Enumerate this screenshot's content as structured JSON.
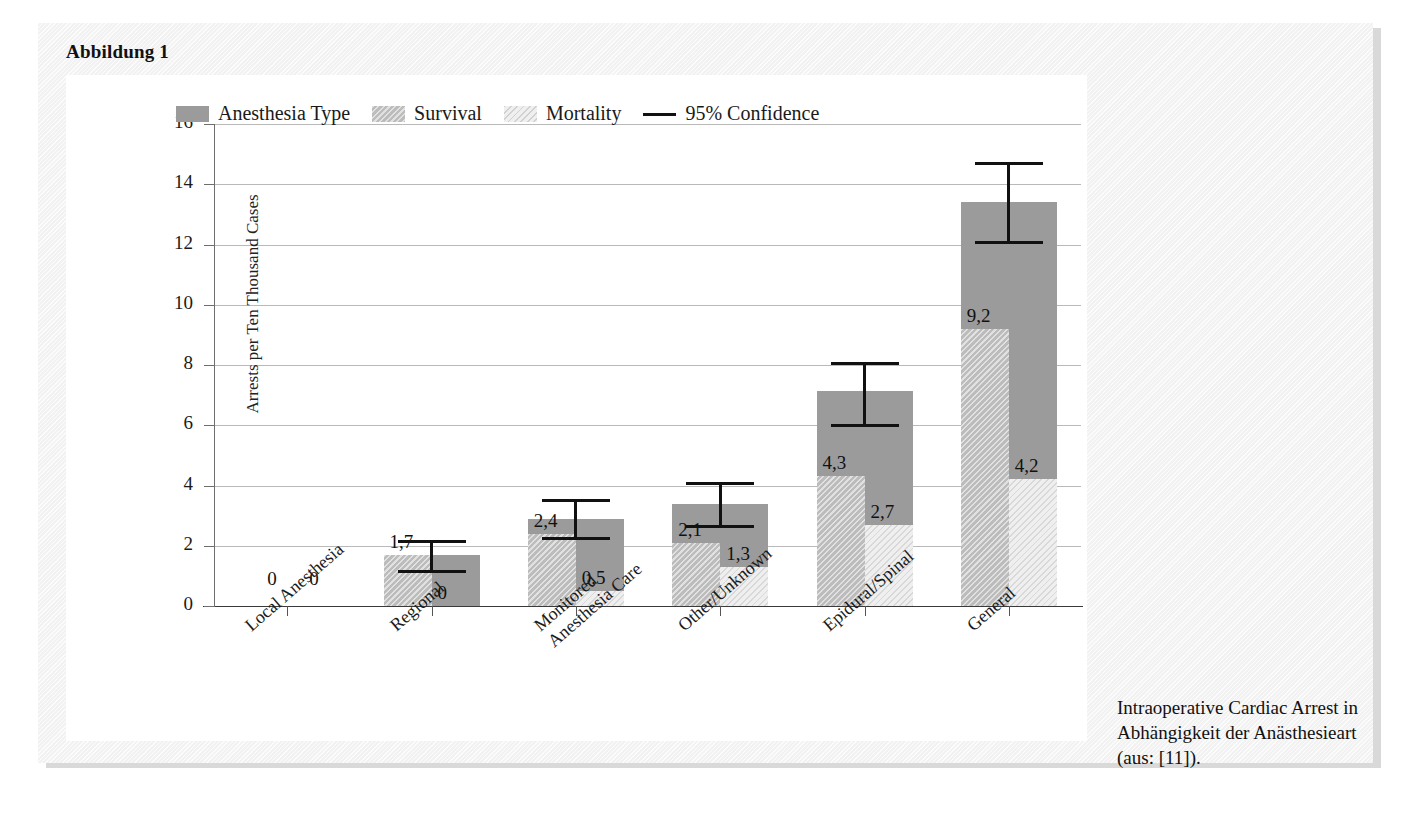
{
  "figure": {
    "title": "Abbildung 1",
    "caption": "Intraoperative Cardiac Arrest in Abhängigkeit der Anästhesieart (aus: [11])."
  },
  "legend": {
    "items": [
      {
        "label": "Anesthesia Type",
        "swatch": "solid",
        "color": "#9b9b9b"
      },
      {
        "label": "Survival",
        "swatch": "hatch",
        "color": "#bcbcbc"
      },
      {
        "label": "Mortality",
        "swatch": "light",
        "color": "#efefef"
      },
      {
        "label": "95% Confidence",
        "swatch": "line",
        "color": "#111111"
      }
    ]
  },
  "chart_data": {
    "type": "bar",
    "title": "",
    "xlabel": "",
    "ylabel": "Arrests per Ten Thousand Cases",
    "ylim": [
      0,
      16
    ],
    "yticks": [
      0,
      2,
      4,
      6,
      8,
      10,
      12,
      14,
      16
    ],
    "ytick_labels": [
      "0",
      "2",
      "4",
      "6",
      "8",
      "10",
      "12",
      "14",
      "16"
    ],
    "grid": true,
    "legend_position": "top-left-inside",
    "categories": [
      "Local Anesthesia",
      "Regional",
      "Monitored Anesthesia Care",
      "Other/Unknown",
      "Epidural/Spinal",
      "General"
    ],
    "category_lines": [
      [
        "Local Anesthesia"
      ],
      [
        "Regional"
      ],
      [
        "Monitored",
        "Anesthesia Care"
      ],
      [
        "Other/Unknown"
      ],
      [
        "Epidural/Spinal"
      ],
      [
        "General"
      ]
    ],
    "series": [
      {
        "name": "Anesthesia Type",
        "values": [
          0,
          1.7,
          2.9,
          3.4,
          7.15,
          13.4
        ]
      },
      {
        "name": "Survival",
        "values": [
          0,
          1.7,
          2.4,
          2.1,
          4.3,
          9.2
        ]
      },
      {
        "name": "Mortality",
        "values": [
          0,
          0,
          0.5,
          1.3,
          2.7,
          4.2
        ]
      }
    ],
    "survival_labels": [
      "0",
      "1,7",
      "2,4",
      "2,1",
      "4,3",
      "9,2"
    ],
    "mortality_labels": [
      "0",
      "0",
      "0,5",
      "1,3",
      "2,7",
      "4,2"
    ],
    "confidence_intervals": [
      {
        "lower": null,
        "upper": null
      },
      {
        "lower": 1.2,
        "upper": 2.2
      },
      {
        "lower": 2.3,
        "upper": 3.55
      },
      {
        "lower": 2.7,
        "upper": 4.1
      },
      {
        "lower": 6.05,
        "upper": 8.1
      },
      {
        "lower": 12.1,
        "upper": 14.75
      }
    ]
  }
}
